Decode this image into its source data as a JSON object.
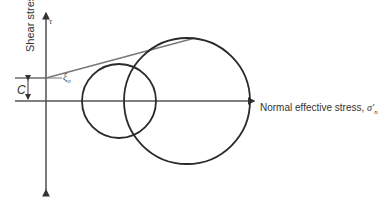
{
  "diagram": {
    "type": "Mohr circles with failure envelope",
    "y_axis": {
      "label": "Shear stress",
      "symbol": "τ"
    },
    "x_axis": {
      "label": "Normal effective stress, ",
      "symbol": "σ'",
      "subscript": "n"
    },
    "cohesion_label": "C",
    "angle_label": {
      "symbol": "ξ",
      "subscript": "o"
    },
    "colors": {
      "axis": "#333333",
      "circle": "#2a2a2a",
      "envelope": "#777777"
    },
    "circles": [
      {
        "name": "small-mohr-circle",
        "cx": 119,
        "cy": 101,
        "r": 37
      },
      {
        "name": "large-mohr-circle",
        "cx": 187,
        "cy": 101,
        "r": 63
      }
    ],
    "envelope": {
      "x1": 46,
      "y1": 78,
      "x2": 195,
      "y2": 38
    }
  }
}
